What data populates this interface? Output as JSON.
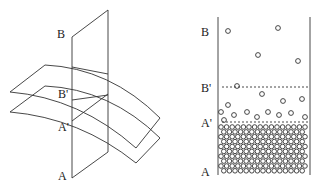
{
  "left_panel": {
    "labels": {
      "B": "B",
      "B_prime": "B'",
      "A_prime": "A'",
      "A": "A"
    }
  },
  "right_panel": {
    "labels": {
      "B": "B",
      "B_prime": "B'",
      "A_prime": "A'",
      "A": "A"
    },
    "free_particles": [
      [
        228,
        31
      ],
      [
        278,
        28
      ],
      [
        258,
        55
      ],
      [
        298,
        61
      ],
      [
        237,
        86
      ],
      [
        262,
        94
      ],
      [
        228,
        105
      ],
      [
        283,
        101
      ],
      [
        302,
        99
      ],
      [
        221,
        112
      ],
      [
        234,
        115
      ],
      [
        247,
        112
      ],
      [
        257,
        117
      ],
      [
        268,
        112
      ],
      [
        279,
        115
      ],
      [
        291,
        113
      ],
      [
        305,
        117
      ],
      [
        224,
        120
      ]
    ],
    "packed_region": {
      "x_start": 221,
      "x_end": 307,
      "y_start": 127,
      "y_end": 172,
      "spacing": 5.6
    }
  },
  "colors": {
    "stroke": "#333333",
    "label": "#222222"
  }
}
